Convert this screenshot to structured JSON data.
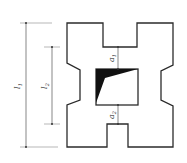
{
  "diagram": {
    "type": "cross-section",
    "labels": {
      "l1": {
        "main": "l",
        "sub": "1"
      },
      "l2": {
        "main": "l",
        "sub": "2"
      },
      "a1": {
        "main": "a",
        "sub": "1"
      },
      "a2": {
        "main": "a",
        "sub": "2"
      }
    },
    "colors": {
      "outline": "#2b2b2b",
      "dimension": "#555555",
      "fill": "#111111"
    }
  }
}
